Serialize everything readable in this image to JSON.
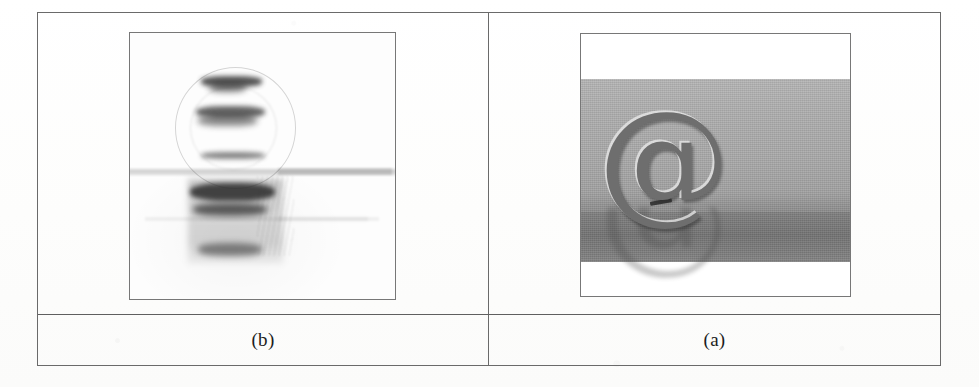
{
  "figure": {
    "type": "two-panel-image-table",
    "columns": 2,
    "rows": 2,
    "border_color": "#6a6a6a",
    "page_background": "#ffffff",
    "panels": [
      {
        "id": "panel-b",
        "caption": "(b)",
        "position": "left",
        "image_kind": "high-pass-edge-filtered",
        "description": "Edge / high-pass filtered grayscale rendering of the @ symbol photograph, showing dark horizontal edge bands on a near-white background",
        "background": "#fdfdfd",
        "dominant_ink": "#2b2b2b"
      },
      {
        "id": "panel-a",
        "caption": "(a)",
        "position": "right",
        "image_kind": "original-grayscale-photograph",
        "description": "Original grayscale photograph of a metallic @ symbol sculpture standing on a reflective surface against a plain gray background",
        "subject_glyph": "@",
        "background": "#a8a8a8",
        "dominant_ink": "#6e6e6e"
      }
    ]
  },
  "captions": {
    "left": "(b)",
    "right": "(a)"
  },
  "glyphs": {
    "at_symbol": "@"
  }
}
